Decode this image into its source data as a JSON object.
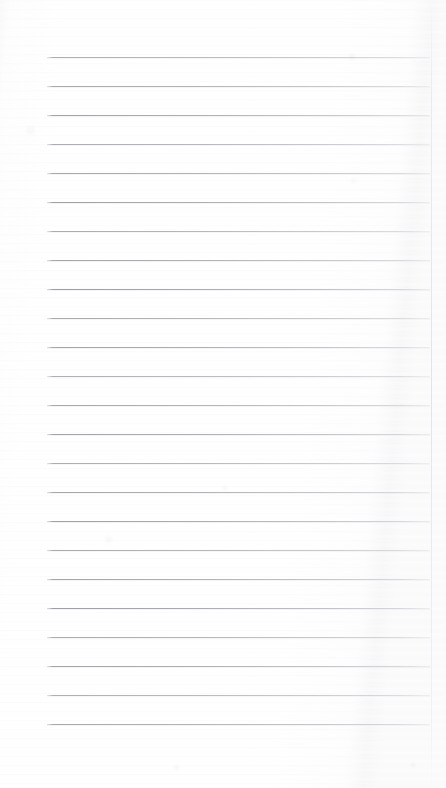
{
  "document": {
    "kind": "scanned-blank-lined-notebook-page",
    "page_title": "",
    "body_text": "",
    "visible_text": "",
    "width_px": 446,
    "height_px": 788
  },
  "page": {
    "background_color": "#fefefe",
    "paper_tone_left": "#f7f7f8",
    "paper_tone_right": "#f6f6f7",
    "right_edge_color": "#d8dadd"
  },
  "ruling": {
    "line_color": "#9a9ca1",
    "line_count": 24,
    "line_thickness_px": 1,
    "left_margin_px": 47,
    "right_margin_px": 430,
    "first_line_y_px": 57,
    "line_spacing_px": 29,
    "lines_y": [
      57,
      86,
      115,
      144,
      173,
      202,
      231,
      260,
      289,
      318,
      347,
      376,
      405,
      434,
      463,
      492,
      521,
      550,
      579,
      608,
      637,
      666,
      695,
      724
    ],
    "bottom_blank_area_y_px": 724
  },
  "marks": [
    {
      "x": 352,
      "y": 57,
      "size": 6,
      "opacity": 0.05
    },
    {
      "x": 353,
      "y": 180,
      "size": 5,
      "opacity": 0.04
    },
    {
      "x": 108,
      "y": 539,
      "size": 7,
      "opacity": 0.045
    },
    {
      "x": 225,
      "y": 488,
      "size": 6,
      "opacity": 0.04
    },
    {
      "x": 176,
      "y": 767,
      "size": 5,
      "opacity": 0.05
    },
    {
      "x": 413,
      "y": 765,
      "size": 4,
      "opacity": 0.06
    },
    {
      "x": 30,
      "y": 130,
      "size": 9,
      "opacity": 0.035
    }
  ]
}
